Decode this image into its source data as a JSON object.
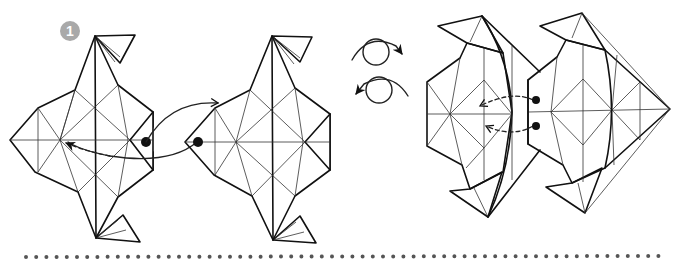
{
  "step": {
    "number": "1",
    "badge_color": "#a9a9a9"
  },
  "figures": [
    {
      "name": "model-front-light",
      "fill": "#dedede"
    },
    {
      "name": "model-front-dark",
      "fill": "#b9b9b9"
    },
    {
      "name": "model-turned-over",
      "fill": "#ffffff"
    }
  ],
  "symbols": [
    {
      "name": "turn-over-right-icon"
    },
    {
      "name": "turn-over-left-icon"
    }
  ],
  "separator": {
    "style": "dotted",
    "color": "#555555"
  }
}
